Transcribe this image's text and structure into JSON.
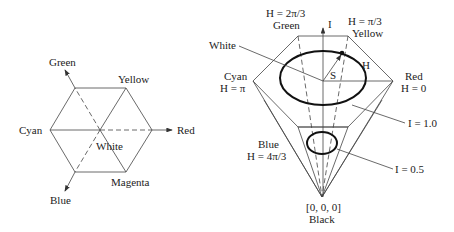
{
  "left_diagram": {
    "labels": {
      "green": "Green",
      "yellow": "Yellow",
      "cyan": "Cyan",
      "red": "Red",
      "white": "White",
      "magenta": "Magenta",
      "blue": "Blue"
    }
  },
  "right_diagram": {
    "labels": {
      "green_h": "H = 2π/3",
      "green": "Green",
      "axis_i": "I",
      "yellow_h": "H = π/3",
      "yellow": "Yellow",
      "white": "White",
      "cyan": "Cyan",
      "cyan_h": "H = π",
      "s": "S",
      "h": "H",
      "red": "Red",
      "red_h": "H = 0",
      "i_one": "I = 1.0",
      "blue": "Blue",
      "blue_h": "H = 4π/3",
      "i_half": "I = 0.5",
      "origin": "[0, 0, 0]",
      "black": "Black"
    }
  },
  "colors": {
    "line": "#444444",
    "text": "#222222",
    "background": "#ffffff"
  }
}
